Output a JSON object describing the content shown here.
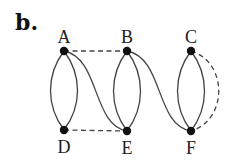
{
  "panel_label": "b.",
  "nodes": [
    {
      "id": "A",
      "label": "A",
      "x": 64,
      "y": 51,
      "label_pos": "top"
    },
    {
      "id": "B",
      "label": "B",
      "x": 127,
      "y": 51,
      "label_pos": "top"
    },
    {
      "id": "C",
      "label": "C",
      "x": 191,
      "y": 51,
      "label_pos": "top"
    },
    {
      "id": "D",
      "label": "D",
      "x": 64,
      "y": 130,
      "label_pos": "bottom"
    },
    {
      "id": "E",
      "label": "E",
      "x": 127,
      "y": 131,
      "label_pos": "bottom"
    },
    {
      "id": "F",
      "label": "F",
      "x": 191,
      "y": 131,
      "label_pos": "bottom"
    }
  ],
  "edges": [
    {
      "from": "A",
      "to": "D",
      "style": "solid",
      "shape": "arc-left"
    },
    {
      "from": "A",
      "to": "D",
      "style": "solid",
      "shape": "arc-right"
    },
    {
      "from": "A",
      "to": "E",
      "style": "solid",
      "shape": "s-curve"
    },
    {
      "from": "A",
      "to": "B",
      "style": "dashed",
      "shape": "straight"
    },
    {
      "from": "D",
      "to": "E",
      "style": "dashed",
      "shape": "straight"
    },
    {
      "from": "B",
      "to": "E",
      "style": "solid",
      "shape": "arc-left"
    },
    {
      "from": "B",
      "to": "E",
      "style": "solid",
      "shape": "arc-right"
    },
    {
      "from": "B",
      "to": "F",
      "style": "solid",
      "shape": "s-curve"
    },
    {
      "from": "C",
      "to": "F",
      "style": "solid",
      "shape": "arc-left"
    },
    {
      "from": "C",
      "to": "F",
      "style": "solid",
      "shape": "arc-right"
    },
    {
      "from": "C",
      "to": "F",
      "style": "dashed",
      "shape": "arc-far-right"
    }
  ],
  "colors": {
    "edge": "#444444",
    "node": "#111111",
    "background": "#ffffff"
  }
}
